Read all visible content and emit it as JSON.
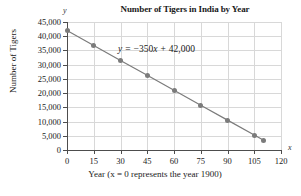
{
  "chart_data": {
    "type": "line",
    "title": "Number of Tigers in India by Year",
    "xlabel": "Year (x = 0 represents the year 1900)",
    "ylabel": "Number of Tigers",
    "axis_letter_x": "x",
    "axis_letter_y": "y",
    "annotation": "y = −350x + 42,000",
    "annotation_parts": {
      "lhs": "y",
      "equals": "=",
      "slope": "−350",
      "variable": "x",
      "plus": "+",
      "intercept": "42,000"
    },
    "grid": true,
    "legend": "none",
    "xlim": [
      0,
      120
    ],
    "ylim": [
      0,
      45000
    ],
    "xticks": [
      0,
      15,
      30,
      45,
      60,
      75,
      90,
      105,
      120
    ],
    "xtick_labels": [
      "0",
      "15",
      "30",
      "45",
      "60",
      "75",
      "90",
      "105",
      "120"
    ],
    "yticks": [
      0,
      5000,
      10000,
      15000,
      20000,
      25000,
      30000,
      35000,
      40000,
      45000
    ],
    "ytick_labels": [
      "0",
      "5,000",
      "10,000",
      "15,000",
      "20,000",
      "25,000",
      "30,000",
      "35,000",
      "40,000",
      "45,000"
    ],
    "series": [
      {
        "name": "Number of Tigers",
        "color": "#7b7b7b",
        "x": [
          0,
          15,
          30,
          45,
          60,
          75,
          90,
          105,
          110
        ],
        "values": [
          42000,
          36750,
          31500,
          26250,
          21000,
          15750,
          10500,
          5250,
          3500
        ]
      }
    ]
  }
}
